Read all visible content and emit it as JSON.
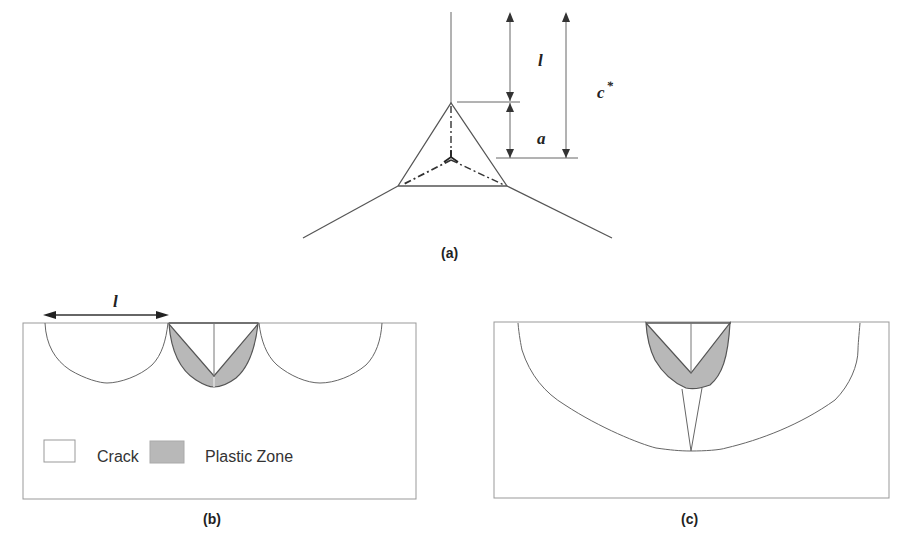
{
  "figure": {
    "panel_a": {
      "caption": "(a)",
      "labels": {
        "l": "l",
        "a": "a",
        "c_star": "c",
        "c_star_sup": "*"
      }
    },
    "panel_b": {
      "caption": "(b)",
      "dimension_label": "l",
      "legend": [
        {
          "label": "Crack",
          "swatch_color": "#ffffff"
        },
        {
          "label": "Plastic Zone",
          "swatch_color": "#b8b8b8"
        }
      ]
    },
    "panel_c": {
      "caption": "(c)"
    },
    "colors": {
      "line": "#555555",
      "plastic_zone_fill": "#b8b8b8",
      "box_border": "#999999"
    }
  }
}
